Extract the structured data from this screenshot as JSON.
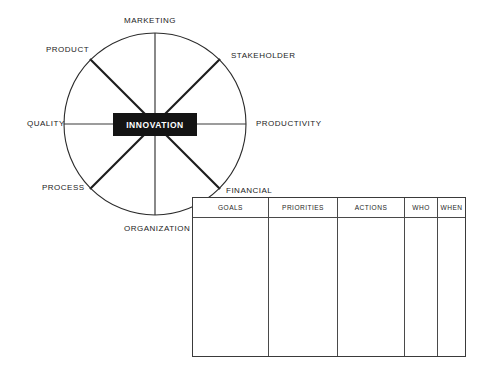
{
  "diagram": {
    "title_box": {
      "label": "INNOVATION",
      "background": "#141414",
      "text_color": "#ffffff"
    },
    "wheel": {
      "center_x": 155,
      "center_y": 124,
      "radius": 91,
      "stroke": "#2b2b2b",
      "spokes": [
        {
          "name": "marketing",
          "label": "MARKETING",
          "angle_deg": 90,
          "style": "axis"
        },
        {
          "name": "stakeholder",
          "label": "STAKEHOLDER",
          "angle_deg": 45,
          "style": "diag"
        },
        {
          "name": "productivity",
          "label": "PRODUCTIVITY",
          "angle_deg": 0,
          "style": "axis"
        },
        {
          "name": "financial",
          "label": "FINANCIAL",
          "angle_deg": -45,
          "style": "diag"
        },
        {
          "name": "organization",
          "label": "ORGANIZATION",
          "angle_deg": -90,
          "style": "axis"
        },
        {
          "name": "process",
          "label": "PROCESS",
          "angle_deg": -135,
          "style": "diag"
        },
        {
          "name": "quality",
          "label": "QUALITY",
          "angle_deg": 180,
          "style": "axis"
        },
        {
          "name": "product",
          "label": "PRODUCT",
          "angle_deg": 135,
          "style": "diag"
        }
      ]
    }
  },
  "table": {
    "columns": [
      {
        "name": "goals",
        "label": "GOALS",
        "width": 76
      },
      {
        "name": "priorities",
        "label": "PRIORITIES",
        "width": 69
      },
      {
        "name": "actions",
        "label": "ACTIONS",
        "width": 67
      },
      {
        "name": "who",
        "label": "WHO",
        "width": 33
      },
      {
        "name": "when",
        "label": "WHEN",
        "width": 29
      }
    ],
    "rows": []
  }
}
